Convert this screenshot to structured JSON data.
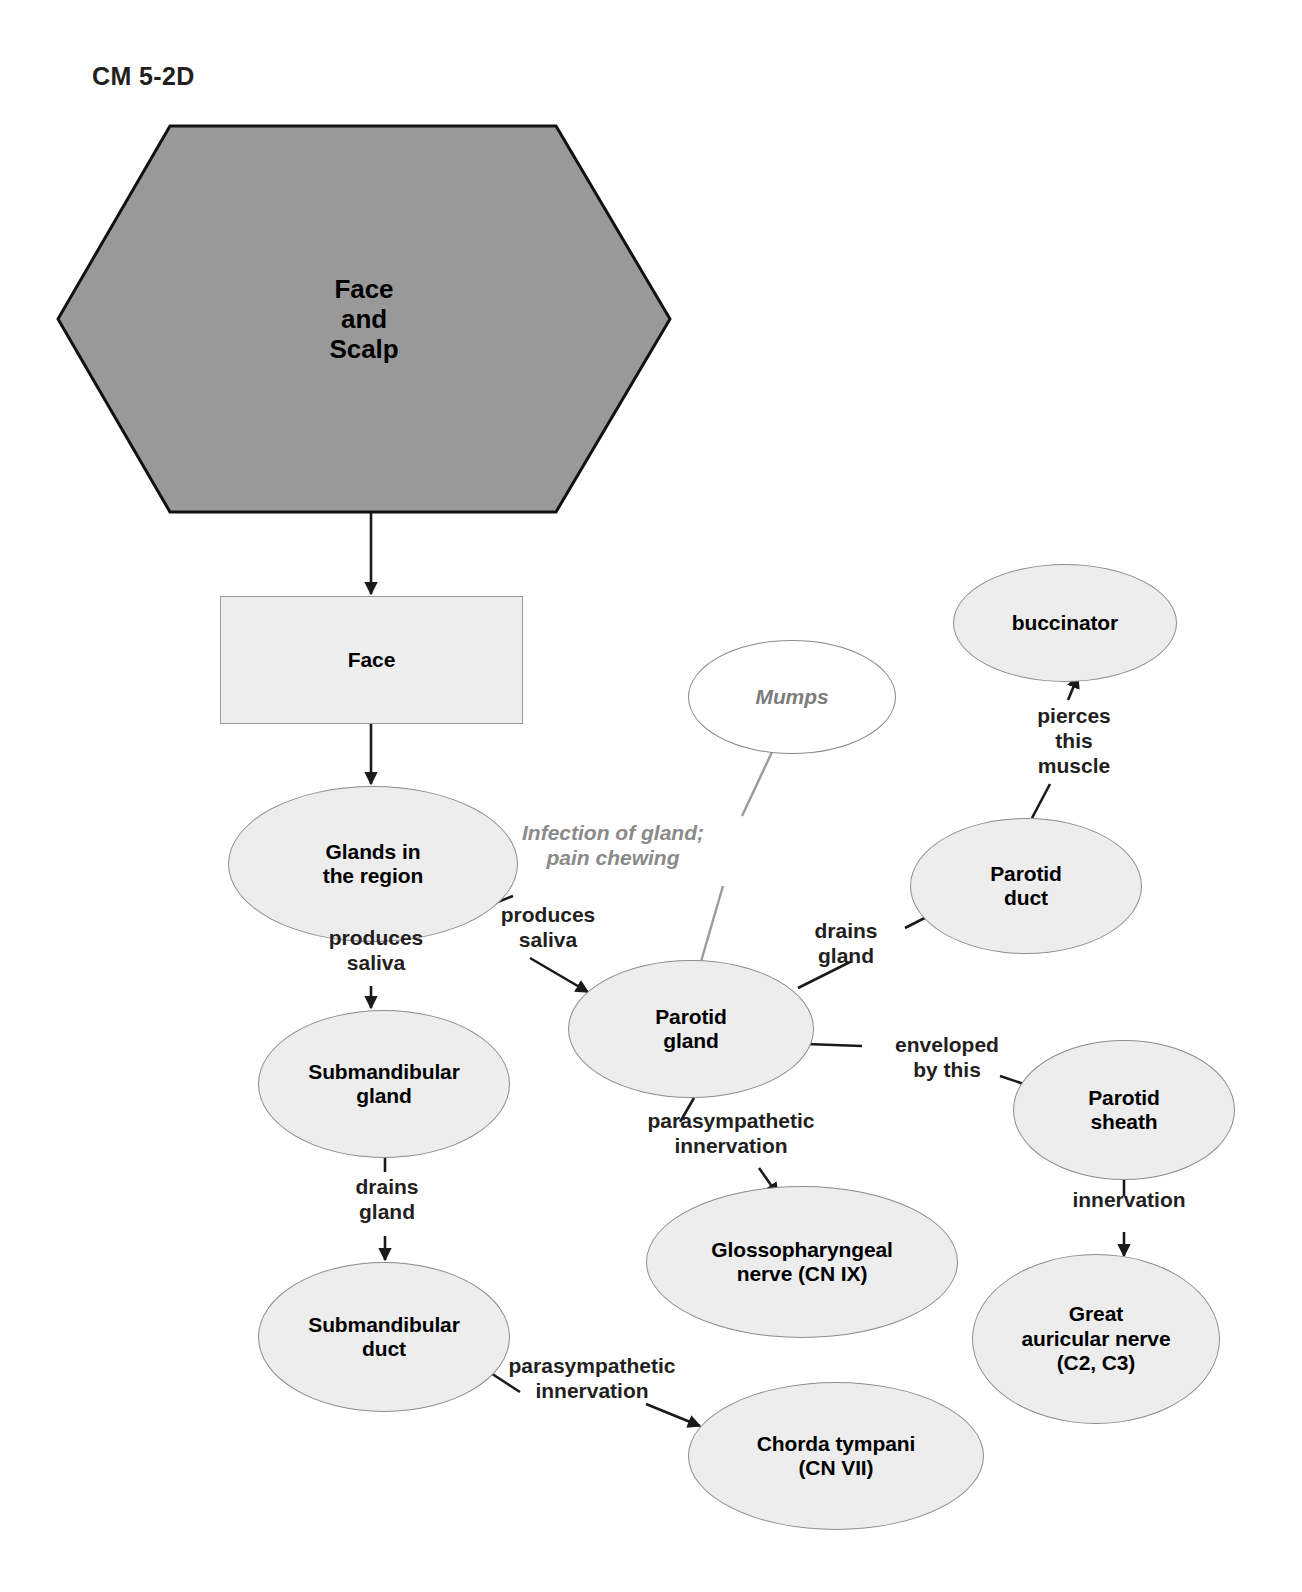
{
  "title": "CM 5-2D",
  "diagram": {
    "type": "concept-map",
    "root": {
      "id": "face-and-scalp",
      "shape": "hexagon",
      "label": "Face\nand\nScalp",
      "fill": "#999999",
      "stroke": "#111111"
    },
    "nodes": [
      {
        "id": "face",
        "shape": "rectangle",
        "label": "Face",
        "fill": "#eeeeee",
        "stroke": "#9a9a9a"
      },
      {
        "id": "glands-in-the-region",
        "shape": "ellipse",
        "label": "Glands in\nthe region",
        "fill": "#ededed",
        "stroke": "#8d8d8d"
      },
      {
        "id": "submandibular-gland",
        "shape": "ellipse",
        "label": "Submandibular\ngland",
        "fill": "#ededed",
        "stroke": "#8d8d8d"
      },
      {
        "id": "submandibular-duct",
        "shape": "ellipse",
        "label": "Submandibular\nduct",
        "fill": "#ededed",
        "stroke": "#8d8d8d"
      },
      {
        "id": "chorda-tympani",
        "shape": "ellipse",
        "label": "Chorda tympani\n(CN VII)",
        "fill": "#ededed",
        "stroke": "#8d8d8d"
      },
      {
        "id": "parotid-gland",
        "shape": "ellipse",
        "label": "Parotid\ngland",
        "fill": "#ededed",
        "stroke": "#8d8d8d"
      },
      {
        "id": "mumps",
        "shape": "ellipse-open",
        "label": "Mumps",
        "fill": "#ffffff",
        "stroke": "#8a8a8a",
        "style": "italic-gray"
      },
      {
        "id": "parotid-duct",
        "shape": "ellipse",
        "label": "Parotid\nduct",
        "fill": "#ededed",
        "stroke": "#8d8d8d"
      },
      {
        "id": "buccinator",
        "shape": "ellipse",
        "label": "buccinator",
        "fill": "#ededed",
        "stroke": "#8d8d8d"
      },
      {
        "id": "parotid-sheath",
        "shape": "ellipse",
        "label": "Parotid\nsheath",
        "fill": "#ededed",
        "stroke": "#8d8d8d"
      },
      {
        "id": "great-auricular-nerve",
        "shape": "ellipse",
        "label": "Great\nauricular nerve\n(C2, C3)",
        "fill": "#ededed",
        "stroke": "#8d8d8d"
      },
      {
        "id": "glossopharyngeal-nerve",
        "shape": "ellipse",
        "label": "Glossopharyngeal\nnerve (CN IX)",
        "fill": "#ededed",
        "stroke": "#8d8d8d"
      }
    ],
    "edges": [
      {
        "from": "face-and-scalp",
        "to": "face",
        "label": "",
        "arrow": true
      },
      {
        "from": "face",
        "to": "glands-in-the-region",
        "label": "",
        "arrow": true
      },
      {
        "from": "glands-in-the-region",
        "to": "submandibular-gland",
        "label": "produces\nsaliva",
        "arrow": true
      },
      {
        "from": "glands-in-the-region",
        "to": "parotid-gland",
        "label": "produces\nsaliva",
        "arrow": true
      },
      {
        "from": "submandibular-gland",
        "to": "submandibular-duct",
        "label": "drains\ngland",
        "arrow": true
      },
      {
        "from": "submandibular-duct",
        "to": "chorda-tympani",
        "label": "parasympathetic\ninnervation",
        "arrow": true
      },
      {
        "from": "mumps",
        "to": "parotid-gland",
        "label": "Infection of gland;\npain chewing",
        "arrow": false,
        "style": "note"
      },
      {
        "from": "parotid-gland",
        "to": "parotid-duct",
        "label": "drains\ngland",
        "arrow": true
      },
      {
        "from": "parotid-duct",
        "to": "buccinator",
        "label": "pierces\nthis\nmuscle",
        "arrow": true
      },
      {
        "from": "parotid-gland",
        "to": "parotid-sheath",
        "label": "enveloped\nby this",
        "arrow": true
      },
      {
        "from": "parotid-sheath",
        "to": "great-auricular-nerve",
        "label": "innervation",
        "arrow": true
      },
      {
        "from": "parotid-gland",
        "to": "glossopharyngeal-nerve",
        "label": "parasympathetic\ninnervation",
        "arrow": true
      }
    ]
  },
  "labels": {
    "produces_saliva_left": "produces\nsaliva",
    "produces_saliva_right": "produces\nsaliva",
    "drains_gland_submandibular": "drains\ngland",
    "parasympathetic_chorda": "parasympathetic\ninnervation",
    "mumps_note": "Infection of gland;\npain chewing",
    "drains_gland_parotid": "drains\ngland",
    "enveloped_by_this": "enveloped\nby this",
    "parasympathetic_glosso": "parasympathetic\ninnervation",
    "pierces_this_muscle": "pierces\nthis\nmuscle",
    "innervation": "innervation"
  },
  "node_labels": {
    "face_and_scalp": "Face\nand\nScalp",
    "face": "Face",
    "glands_in_the_region": "Glands in\nthe region",
    "submandibular_gland": "Submandibular\ngland",
    "submandibular_duct": "Submandibular\nduct",
    "chorda_tympani": "Chorda tympani\n(CN VII)",
    "parotid_gland": "Parotid\ngland",
    "mumps": "Mumps",
    "parotid_duct": "Parotid\nduct",
    "buccinator": "buccinator",
    "parotid_sheath": "Parotid\nsheath",
    "great_auricular_nerve": "Great\nauricular nerve\n(C2, C3)",
    "glossopharyngeal_nerve": "Glossopharyngeal\nnerve (CN IX)"
  },
  "colors": {
    "hexagon_fill": "#999999",
    "node_fill": "#ededed",
    "node_stroke": "#8d8d8d",
    "edge_stroke": "#1a1a1a",
    "note_color": "#8a8a8a",
    "text": "#000000",
    "background": "#ffffff"
  }
}
